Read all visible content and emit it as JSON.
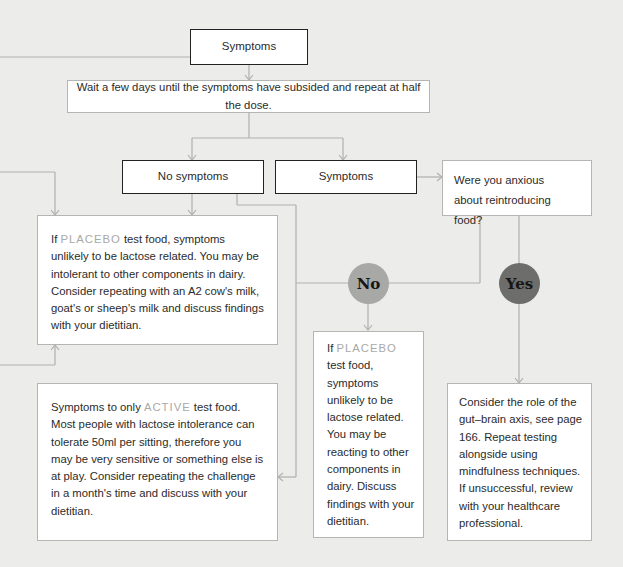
{
  "flowchart": {
    "top_symptoms": "Symptoms",
    "wait_step": "Wait a few days until the symptoms have subsided and repeat at half the dose.",
    "no_symptoms": "No symptoms",
    "symptoms_branch": "Symptoms",
    "question": {
      "line1": "Were you anxious",
      "line2": "about reintroducing food?"
    },
    "placebo_box_left": {
      "prefix": "If ",
      "highlight": "PLACEBO",
      "text": " test food, symptoms unlikely to be lactose related. You may be intolerant to other components in dairy. Consider repeating with an A2 cow's milk, goat's or sheep's milk and discuss findings with your dietitian."
    },
    "active_box": {
      "prefix": "Symptoms to only ",
      "highlight": "ACTIVE",
      "text": " test food. Most people with lactose intolerance can tolerate 50ml per sitting, therefore you may be very sensitive or something else is at play. Consider repeating the challenge in a month's time and discuss with your dietitian."
    },
    "no_label": "No",
    "yes_label": "Yes",
    "placebo_box_middle": {
      "prefix": "If ",
      "highlight": "PLACEBO",
      "text": " test food, symptoms unlikely to be lactose related. You may be reacting to other components in dairy. Discuss findings with your dietitian."
    },
    "gut_brain_box": {
      "text": "Consider the role of the gut–brain axis, see page 166. Repeat testing alongside using mindfulness techniques. If unsuccessful, review with your healthcare professional."
    }
  },
  "colors": {
    "background": "#ececea",
    "line": "#b0b0ae",
    "highlight_text": "#a9a9a7",
    "no_circle": "#a8a8a6",
    "yes_circle": "#6d6d6b"
  }
}
